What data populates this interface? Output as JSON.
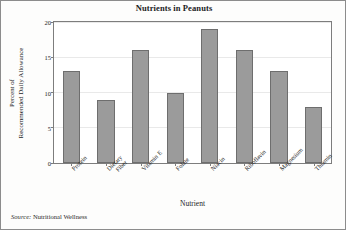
{
  "chart_data": {
    "type": "bar",
    "title": "Nutrients in Peanuts",
    "xlabel": "Nutrient",
    "ylabel_lines": [
      "Percent of",
      "Recommended Daily Allowance"
    ],
    "ylabel": "Percent of Recommended Daily Allowance",
    "categories": [
      "Protein",
      "Dietary Fiber",
      "Vitamin E",
      "Folate",
      "Niacin",
      "Riboflavin",
      "Magnesium",
      "Thiamin"
    ],
    "category_lines": [
      [
        "Protein"
      ],
      [
        "Dietary",
        "Fiber"
      ],
      [
        "Vitamin E"
      ],
      [
        "Folate"
      ],
      [
        "Niacin"
      ],
      [
        "Riboflavin"
      ],
      [
        "Magnesium"
      ],
      [
        "Thiamin"
      ]
    ],
    "values": [
      13,
      9,
      16,
      10,
      19,
      16,
      13,
      8
    ],
    "ylim": [
      0,
      20
    ],
    "yticks": [
      0,
      5,
      10,
      15,
      20
    ],
    "ytick_labels": [
      "0",
      "5",
      "10",
      "15",
      "20"
    ],
    "grid": true,
    "grid_axis": "y",
    "legend": false,
    "bar_color": "#9b9b9b",
    "bar_edge_color": "#6e6e6e",
    "frame_color": "#7d7d7d",
    "grid_color": "#e9e9e9",
    "text_color": "#1c1c1c"
  },
  "source": {
    "key": "Source:",
    "value": "Nutritional Wellness"
  }
}
